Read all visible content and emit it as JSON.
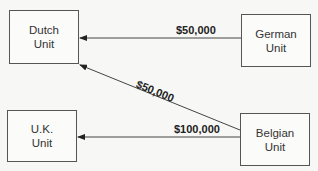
{
  "diagram": {
    "nodes": [
      {
        "id": "dutch",
        "label": "Dutch\nUnit"
      },
      {
        "id": "german",
        "label": "German\nUnit"
      },
      {
        "id": "uk",
        "label": "U.K.\nUnit"
      },
      {
        "id": "belgian",
        "label": "Belgian\nUnit"
      }
    ],
    "edges": [
      {
        "from": "german",
        "to": "dutch",
        "label": "$50,000"
      },
      {
        "from": "belgian",
        "to": "dutch",
        "label": "$50,000"
      },
      {
        "from": "belgian",
        "to": "uk",
        "label": "$100,000"
      }
    ]
  }
}
